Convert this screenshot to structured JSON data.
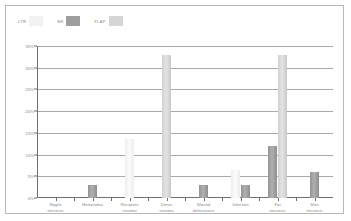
{
  "chart_data": {
    "type": "bar",
    "title": "",
    "subtitle": "",
    "xlabel": "",
    "ylabel": "",
    "ylim": [
      0,
      35
    ],
    "grid": true,
    "legend_position": "top-left",
    "ytick_labels": [
      "35%",
      "30%",
      "25%",
      "20%",
      "15%",
      "10%",
      "5%",
      "0%"
    ],
    "ytick_values": [
      35,
      30,
      25,
      20,
      15,
      10,
      5,
      0
    ],
    "categories": [
      "Nipple\nnecrosis",
      "Hematoma",
      "Recipient\nseroma",
      "Donor\nseroma",
      "Wound\ndehiscence",
      "Infection",
      "Fat\nnecrosis",
      "Skin\nnecrosis"
    ],
    "series": [
      {
        "name": "LTR",
        "color": "#f2f2f2",
        "values": [
          0,
          0,
          13.5,
          0,
          0,
          6.5,
          0,
          0
        ]
      },
      {
        "name": "BR",
        "color": "#9e9e9e",
        "values": [
          0,
          3,
          0,
          0,
          3,
          3,
          12,
          6
        ]
      },
      {
        "name": "FLAP",
        "color": "#d5d5d5",
        "values": [
          0,
          0,
          0,
          33,
          0,
          0,
          33,
          0
        ]
      }
    ]
  },
  "legend": {
    "items": [
      {
        "label": "LTR",
        "swatch_class": "sw-ltr"
      },
      {
        "label": "BR",
        "swatch_class": "sw-br"
      },
      {
        "label": "FLAP",
        "swatch_class": "sw-flap"
      }
    ]
  },
  "colors": {
    "frame": "#b8b8b8",
    "gridline": "#a9a9a9",
    "axis": "#6f6f6f",
    "text": "#8a8a8a",
    "background": "#ffffff"
  }
}
